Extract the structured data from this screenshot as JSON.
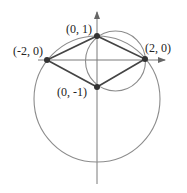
{
  "diagram": {
    "colors": {
      "axis": "#7a7a7a",
      "circle": "#8c8c8c",
      "edge": "#444444",
      "point": "#333333",
      "text": "#222222"
    },
    "points": [
      {
        "id": "p-left",
        "label": "(-2, 0)",
        "x": -2,
        "y": 0
      },
      {
        "id": "p-top",
        "label": "(0, 1)",
        "x": 0,
        "y": 1
      },
      {
        "id": "p-right",
        "label": "(2, 0)",
        "x": 2,
        "y": 0
      },
      {
        "id": "p-bottom",
        "label": "(0, -1)",
        "x": 0,
        "y": -1
      }
    ],
    "polygon": [
      "p-left",
      "p-top",
      "p-right",
      "p-bottom"
    ],
    "circles": [
      {
        "id": "large-circle",
        "center": [
          0,
          -1.5
        ],
        "radius": 2.5,
        "through": [
          "p-left",
          "p-top",
          "p-right"
        ]
      },
      {
        "id": "small-circle",
        "center": [
          0.75,
          0
        ],
        "radius": 1.25,
        "through": [
          "p-top",
          "p-right",
          "p-bottom"
        ]
      }
    ],
    "axes": {
      "x_arrow": true,
      "y_arrow": true
    }
  }
}
